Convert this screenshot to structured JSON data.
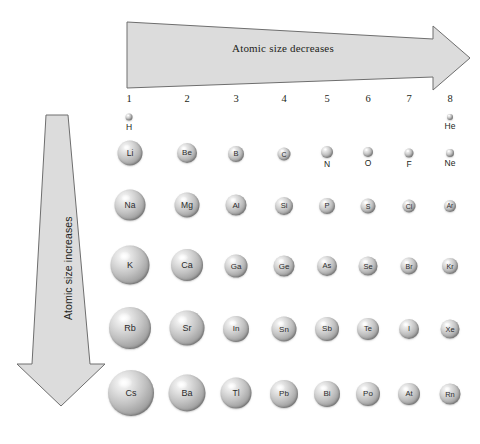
{
  "figure": {
    "width": 480,
    "height": 444,
    "background": "#ffffff"
  },
  "arrows": {
    "horizontal": {
      "label": "Atomic size decreases",
      "direction": "right",
      "taper": "wide-at-left-narrow-at-right",
      "fill": "#dcdcdc",
      "stroke": "#6e6e6e"
    },
    "vertical": {
      "label": "Atomic size increases",
      "direction": "down",
      "taper": "narrow-at-top-wide-at-bottom",
      "fill": "#dcdcdc",
      "stroke": "#6e6e6e"
    }
  },
  "columns": [
    {
      "number": "1",
      "x": 129
    },
    {
      "number": "2",
      "x": 187
    },
    {
      "number": "3",
      "x": 236
    },
    {
      "number": "4",
      "x": 284
    },
    {
      "number": "5",
      "x": 327
    },
    {
      "number": "6",
      "x": 368
    },
    {
      "number": "7",
      "x": 409
    },
    {
      "number": "8",
      "x": 450
    }
  ],
  "chart_data": {
    "type": "scatter",
    "xlabel": "Group (column)",
    "ylabel": "Period (row)",
    "encoding": "marker diameter encodes relative atomic radius",
    "annotations": [
      "Atomic size decreases",
      "Atomic size increases"
    ],
    "rows": [
      {
        "period": 1,
        "y": 118,
        "atoms": [
          {
            "symbol": "H",
            "group": 1,
            "x": 129,
            "y": 117,
            "d": 7,
            "label_pos": "below",
            "font": 8.5
          },
          {
            "symbol": "He",
            "group": 8,
            "x": 450,
            "y": 117,
            "d": 6,
            "label_pos": "below",
            "font": 8.5
          }
        ]
      },
      {
        "period": 2,
        "y": 153,
        "atoms": [
          {
            "symbol": "Li",
            "group": 1,
            "x": 130,
            "y": 153,
            "d": 25,
            "label_pos": "inside",
            "font": 8.5
          },
          {
            "symbol": "Be",
            "group": 2,
            "x": 187,
            "y": 153,
            "d": 20,
            "label_pos": "inside",
            "font": 8
          },
          {
            "symbol": "B",
            "group": 3,
            "x": 236,
            "y": 154,
            "d": 16,
            "label_pos": "inside",
            "font": 7.5
          },
          {
            "symbol": "C",
            "group": 4,
            "x": 284,
            "y": 154,
            "d": 13,
            "label_pos": "inside",
            "font": 7
          },
          {
            "symbol": "N",
            "group": 5,
            "x": 327,
            "y": 152,
            "d": 12,
            "label_pos": "below",
            "font": 8.5
          },
          {
            "symbol": "O",
            "group": 6,
            "x": 368,
            "y": 152,
            "d": 10,
            "label_pos": "below",
            "font": 8.5
          },
          {
            "symbol": "F",
            "group": 7,
            "x": 409,
            "y": 153,
            "d": 9,
            "label_pos": "below",
            "font": 8.5
          },
          {
            "symbol": "Ne",
            "group": 8,
            "x": 450,
            "y": 153,
            "d": 8,
            "label_pos": "below",
            "font": 8.5
          }
        ]
      },
      {
        "period": 3,
        "y": 205,
        "atoms": [
          {
            "symbol": "Na",
            "group": 1,
            "x": 130,
            "y": 205,
            "d": 31,
            "label_pos": "inside",
            "font": 8.5
          },
          {
            "symbol": "Mg",
            "group": 2,
            "x": 187,
            "y": 205,
            "d": 25,
            "label_pos": "inside",
            "font": 8.5
          },
          {
            "symbol": "Al",
            "group": 3,
            "x": 236,
            "y": 205,
            "d": 21,
            "label_pos": "inside",
            "font": 8
          },
          {
            "symbol": "Si",
            "group": 4,
            "x": 284,
            "y": 206,
            "d": 18,
            "label_pos": "inside",
            "font": 7.5
          },
          {
            "symbol": "P",
            "group": 5,
            "x": 327,
            "y": 206,
            "d": 16,
            "label_pos": "inside",
            "font": 7.5
          },
          {
            "symbol": "S",
            "group": 6,
            "x": 368,
            "y": 206,
            "d": 15,
            "label_pos": "inside",
            "font": 7
          },
          {
            "symbol": "Cl",
            "group": 7,
            "x": 409,
            "y": 206,
            "d": 13,
            "label_pos": "inside",
            "font": 7
          },
          {
            "symbol": "Ar",
            "group": 8,
            "x": 450,
            "y": 206,
            "d": 12,
            "label_pos": "inside",
            "font": 6.5
          }
        ]
      },
      {
        "period": 4,
        "y": 265,
        "atoms": [
          {
            "symbol": "K",
            "group": 1,
            "x": 130,
            "y": 265,
            "d": 39,
            "label_pos": "inside",
            "font": 9
          },
          {
            "symbol": "Ca",
            "group": 2,
            "x": 187,
            "y": 265,
            "d": 32,
            "label_pos": "inside",
            "font": 9
          },
          {
            "symbol": "Ga",
            "group": 3,
            "x": 236,
            "y": 266,
            "d": 23,
            "label_pos": "inside",
            "font": 8
          },
          {
            "symbol": "Ge",
            "group": 4,
            "x": 284,
            "y": 266,
            "d": 21,
            "label_pos": "inside",
            "font": 8
          },
          {
            "symbol": "As",
            "group": 5,
            "x": 327,
            "y": 266,
            "d": 20,
            "label_pos": "inside",
            "font": 7.5
          },
          {
            "symbol": "Se",
            "group": 6,
            "x": 368,
            "y": 266,
            "d": 19,
            "label_pos": "inside",
            "font": 7.5
          },
          {
            "symbol": "Br",
            "group": 7,
            "x": 409,
            "y": 266,
            "d": 17,
            "label_pos": "inside",
            "font": 7
          },
          {
            "symbol": "Kr",
            "group": 8,
            "x": 450,
            "y": 266,
            "d": 16,
            "label_pos": "inside",
            "font": 7
          }
        ]
      },
      {
        "period": 5,
        "y": 328,
        "atoms": [
          {
            "symbol": "Rb",
            "group": 1,
            "x": 130,
            "y": 328,
            "d": 42,
            "label_pos": "inside",
            "font": 9
          },
          {
            "symbol": "Sr",
            "group": 2,
            "x": 187,
            "y": 328,
            "d": 35,
            "label_pos": "inside",
            "font": 9
          },
          {
            "symbol": "In",
            "group": 3,
            "x": 236,
            "y": 329,
            "d": 26,
            "label_pos": "inside",
            "font": 8
          },
          {
            "symbol": "Sn",
            "group": 4,
            "x": 284,
            "y": 329,
            "d": 25,
            "label_pos": "inside",
            "font": 8
          },
          {
            "symbol": "Sb",
            "group": 5,
            "x": 327,
            "y": 329,
            "d": 24,
            "label_pos": "inside",
            "font": 8
          },
          {
            "symbol": "Te",
            "group": 6,
            "x": 368,
            "y": 329,
            "d": 22,
            "label_pos": "inside",
            "font": 7.5
          },
          {
            "symbol": "I",
            "group": 7,
            "x": 409,
            "y": 329,
            "d": 20,
            "label_pos": "inside",
            "font": 7.5
          },
          {
            "symbol": "Xe",
            "group": 8,
            "x": 450,
            "y": 329,
            "d": 19,
            "label_pos": "inside",
            "font": 7.5
          }
        ]
      },
      {
        "period": 6,
        "y": 393,
        "atoms": [
          {
            "symbol": "Cs",
            "group": 1,
            "x": 131,
            "y": 393,
            "d": 46,
            "label_pos": "inside",
            "font": 9
          },
          {
            "symbol": "Ba",
            "group": 2,
            "x": 187,
            "y": 393,
            "d": 37,
            "label_pos": "inside",
            "font": 9
          },
          {
            "symbol": "Tl",
            "group": 3,
            "x": 236,
            "y": 393,
            "d": 31,
            "label_pos": "inside",
            "font": 8.5
          },
          {
            "symbol": "Pb",
            "group": 4,
            "x": 284,
            "y": 394,
            "d": 28,
            "label_pos": "inside",
            "font": 8
          },
          {
            "symbol": "Bi",
            "group": 5,
            "x": 327,
            "y": 394,
            "d": 26,
            "label_pos": "inside",
            "font": 8
          },
          {
            "symbol": "Po",
            "group": 6,
            "x": 368,
            "y": 394,
            "d": 24,
            "label_pos": "inside",
            "font": 8
          },
          {
            "symbol": "At",
            "group": 7,
            "x": 409,
            "y": 394,
            "d": 22,
            "label_pos": "inside",
            "font": 7.5
          },
          {
            "symbol": "Rn",
            "group": 8,
            "x": 450,
            "y": 394,
            "d": 21,
            "label_pos": "inside",
            "font": 7.5
          }
        ]
      }
    ]
  }
}
